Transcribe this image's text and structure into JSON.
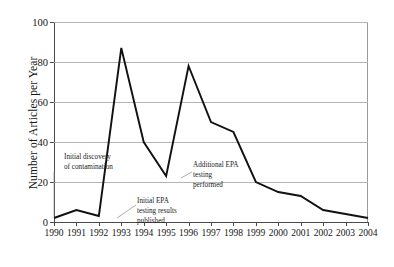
{
  "chart_data": {
    "type": "line",
    "title": "",
    "xlabel": "",
    "ylabel": "Number of Articles per Year",
    "categories": [
      "1990",
      "1991",
      "1992",
      "1993",
      "1994",
      "1995",
      "1996",
      "1997",
      "1998",
      "1999",
      "2000",
      "2001",
      "2002",
      "2003",
      "2004"
    ],
    "x": [
      1990,
      1991,
      1992,
      1993,
      1994,
      1995,
      1996,
      1997,
      1998,
      1999,
      2000,
      2001,
      2002,
      2003,
      2004
    ],
    "values": [
      2,
      6,
      3,
      87,
      40,
      23,
      78,
      50,
      45,
      20,
      15,
      13,
      6,
      4,
      2
    ],
    "series": [
      {
        "name": "Number of Articles per Year",
        "values": [
          2,
          6,
          3,
          87,
          40,
          23,
          78,
          50,
          45,
          20,
          15,
          13,
          6,
          4,
          2
        ]
      }
    ],
    "ylim": [
      0,
      100
    ],
    "xlim": [
      1990,
      2004
    ],
    "yticks": [
      0,
      20,
      40,
      60,
      80,
      100
    ],
    "ytick_labels": [
      "0",
      "20",
      "40",
      "60",
      "80",
      "100"
    ],
    "grid": "horizontal",
    "legend": "none",
    "line_color": "#111111",
    "annotations": [
      {
        "id": "initial-discovery",
        "text": "Initial discovery\nof contamination",
        "points_to_year": 1990,
        "points_to_value": 2
      },
      {
        "id": "initial-epa-testing",
        "text": "Initial EPA\ntesting results\npublished",
        "points_to_year": 1992,
        "points_to_value": 12
      },
      {
        "id": "additional-epa-testing",
        "text": "Additional EPA\ntesting\nperformed",
        "points_to_year": 1995,
        "points_to_value": 23
      }
    ]
  }
}
